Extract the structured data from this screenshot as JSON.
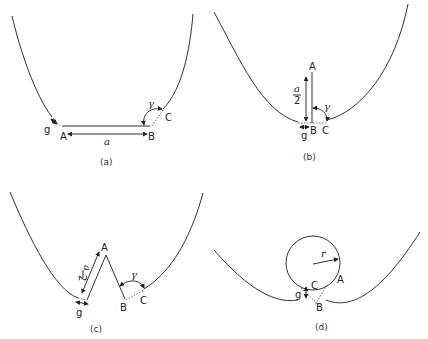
{
  "panels": [
    {
      "id": "a",
      "caption": "(a)",
      "labels": {
        "A": "A",
        "B": "B",
        "C": "C",
        "g": "g",
        "a": "a",
        "gamma": "γ"
      }
    },
    {
      "id": "b",
      "caption": "(b)",
      "labels": {
        "A": "A",
        "B": "B",
        "C": "C",
        "g": "g",
        "a_num": "a",
        "a_den": "2",
        "gamma": "γ"
      }
    },
    {
      "id": "c",
      "caption": "(c)",
      "labels": {
        "A": "A",
        "B": "B",
        "C": "C",
        "g": "g",
        "a_num": "a",
        "a_den": "2",
        "gamma": "γ"
      }
    },
    {
      "id": "d",
      "caption": "(d)",
      "labels": {
        "A": "A",
        "B": "B",
        "C": "C",
        "g": "g",
        "r": "r"
      }
    }
  ]
}
